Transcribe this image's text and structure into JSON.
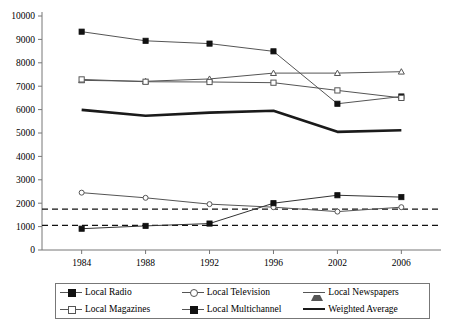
{
  "chart_data": {
    "type": "line",
    "title": "",
    "subtitle": "",
    "xlabel": "",
    "ylabel": "",
    "categories": [
      "1984",
      "1988",
      "1992",
      "1996",
      "2002",
      "2006"
    ],
    "ylim": [
      0,
      10000
    ],
    "ytick_step": 1000,
    "yticks": [
      "0",
      "1000",
      "2000",
      "3000",
      "4000",
      "5000",
      "6000",
      "7000",
      "8000",
      "9000",
      "10000"
    ],
    "grid": false,
    "legend_position": "bottom",
    "series": [
      {
        "name": "Local Radio",
        "marker": "filled-square",
        "line": "solid",
        "color": "#555555",
        "values": [
          9330,
          8940,
          8820,
          8490,
          6250,
          6560
        ]
      },
      {
        "name": "Local Television",
        "marker": "open-circle",
        "line": "solid",
        "color": "#555555",
        "values": [
          2450,
          2230,
          1960,
          1830,
          1640,
          1830
        ]
      },
      {
        "name": "Local Newspapers",
        "marker": "triangle",
        "line": "solid",
        "color": "#555555",
        "values": [
          7250,
          7210,
          7310,
          7560,
          7560,
          7620
        ]
      },
      {
        "name": "Local Magazines",
        "marker": "open-square",
        "line": "solid",
        "color": "#555555",
        "values": [
          7290,
          7190,
          7180,
          7150,
          6820,
          6500
        ]
      },
      {
        "name": "Local Multichannel",
        "marker": "filled-square",
        "line": "solid",
        "color": "#333333",
        "values": [
          910,
          1030,
          1130,
          2000,
          2340,
          2260
        ]
      },
      {
        "name": "Weighted Average",
        "marker": "none",
        "line": "thick-solid",
        "color": "#1a1a1a",
        "values": [
          5990,
          5740,
          5870,
          5950,
          5050,
          5120
        ]
      }
    ],
    "reference_lines": [
      {
        "name": "upper-reference",
        "value": 1750,
        "style": "dashed"
      },
      {
        "name": "lower-reference",
        "value": 1050,
        "style": "dashed"
      }
    ]
  },
  "legend": {
    "items": [
      {
        "label": "Local Radio",
        "marker": "filled-square"
      },
      {
        "label": "Local Television",
        "marker": "open-circle"
      },
      {
        "label": "Local Newspapers",
        "marker": "triangle"
      },
      {
        "label": "Local Magazines",
        "marker": "open-square"
      },
      {
        "label": "Local Multichannel",
        "marker": "filled-square"
      },
      {
        "label": "Weighted Average",
        "marker": "thick-line"
      }
    ]
  }
}
